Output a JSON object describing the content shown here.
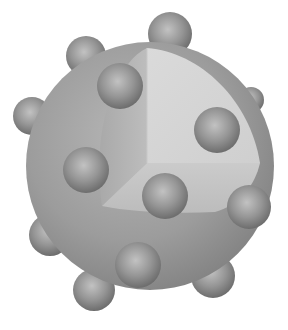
{
  "figure": {
    "colors": {
      "background": "#ffffff",
      "sphere_light": "#b4b4b4",
      "sphere_mid": "#9a9a9a",
      "sphere_dark": "#7c7c7c",
      "cut_back_face": "#d6d6d6",
      "cut_left_face": "#b8b8b8",
      "cut_bottom_face": "#c6c6c6",
      "bump_light": "#bdbdbd",
      "bump_dark": "#6e6e6e"
    },
    "sphere": {
      "cx": 150,
      "cy": 166,
      "r": 124
    },
    "bumps": [
      {
        "cx": 170,
        "cy": 34,
        "r": 22
      },
      {
        "cx": 86,
        "cy": 56,
        "r": 20
      },
      {
        "cx": 120,
        "cy": 86,
        "r": 23
      },
      {
        "cx": 32,
        "cy": 116,
        "r": 19
      },
      {
        "cx": 251,
        "cy": 100,
        "r": 13
      },
      {
        "cx": 217,
        "cy": 130,
        "r": 23
      },
      {
        "cx": 86,
        "cy": 170,
        "r": 23
      },
      {
        "cx": 165,
        "cy": 196,
        "r": 23
      },
      {
        "cx": 50,
        "cy": 235,
        "r": 21
      },
      {
        "cx": 249,
        "cy": 207,
        "r": 22
      },
      {
        "cx": 138,
        "cy": 265,
        "r": 23
      },
      {
        "cx": 213,
        "cy": 276,
        "r": 22
      },
      {
        "cx": 94,
        "cy": 290,
        "r": 21
      }
    ]
  }
}
